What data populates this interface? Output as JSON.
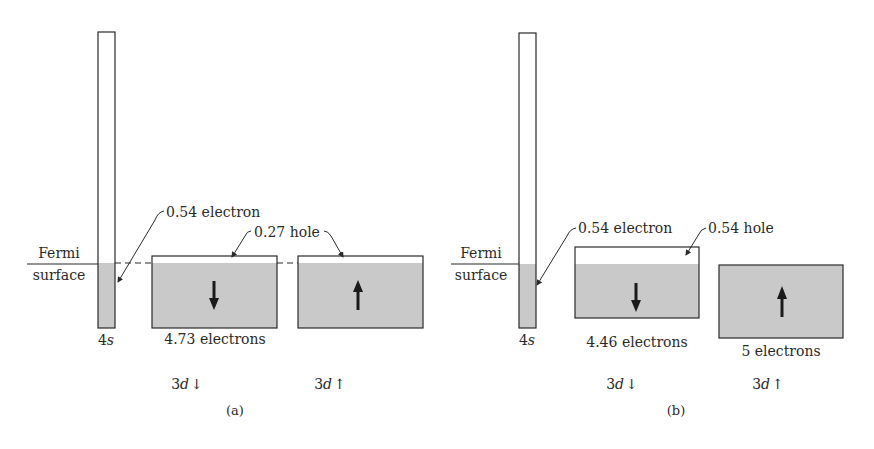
{
  "colors": {
    "ink": "#2a2a2a",
    "fill": "#c9c9c9",
    "paper": "#ffffff"
  },
  "panels": [
    {
      "id": "a",
      "caption": "(a)",
      "fermi_label_top": "Fermi",
      "fermi_label_bottom": "surface",
      "band_4s": {
        "label_main": "4",
        "label_italic": "s",
        "annotation": "0.54 electron"
      },
      "band_3d_down": {
        "spin": "down",
        "count_label": "4.73 electrons",
        "band_label_main": "3",
        "band_label_italic": "d",
        "band_label_arrow": "↓"
      },
      "band_3d_up": {
        "spin": "up",
        "count_label": "",
        "band_label_main": "3",
        "band_label_italic": "d",
        "band_label_arrow": "↑"
      },
      "hole_annotation": "0.27 hole"
    },
    {
      "id": "b",
      "caption": "(b)",
      "fermi_label_top": "Fermi",
      "fermi_label_bottom": "surface",
      "band_4s": {
        "label_main": "4",
        "label_italic": "s",
        "annotation": "0.54 electron"
      },
      "band_3d_down": {
        "spin": "down",
        "count_label": "4.46 electrons",
        "band_label_main": "3",
        "band_label_italic": "d",
        "band_label_arrow": "↓"
      },
      "band_3d_up": {
        "spin": "up",
        "count_label": "5 electrons",
        "band_label_main": "3",
        "band_label_italic": "d",
        "band_label_arrow": "↑"
      },
      "hole_annotation": "0.54 hole"
    }
  ]
}
